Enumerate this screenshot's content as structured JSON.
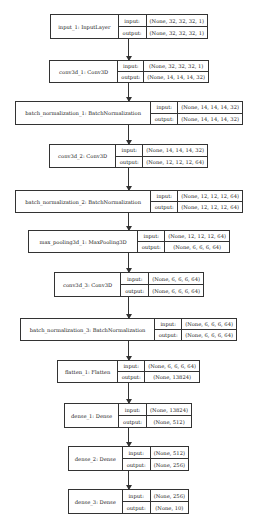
{
  "diagram": {
    "type": "keras_model_plot",
    "io_labels": {
      "input": "input:",
      "output": "output:"
    },
    "nodes": [
      {
        "name": "input_1: InputLayer",
        "input": "(None, 32, 32, 32, 1)",
        "output": "(None, 32, 32, 32, 1)"
      },
      {
        "name": "conv3d_1: Conv3D",
        "input": "(None, 32, 32, 32, 1)",
        "output": "(None, 14, 14, 14, 32)"
      },
      {
        "name": "batch_normalization_1: BatchNormalization",
        "input": "(None, 14, 14, 14, 32)",
        "output": "(None, 14, 14, 14, 32)"
      },
      {
        "name": "conv3d_2: Conv3D",
        "input": "(None, 14, 14, 14, 32)",
        "output": "(None, 12, 12, 12, 64)"
      },
      {
        "name": "batch_normalization_2: BatchNormalization",
        "input": "(None, 12, 12, 12, 64)",
        "output": "(None, 12, 12, 12, 64)"
      },
      {
        "name": "max_pooling3d_1: MaxPooling3D",
        "input": "(None, 12, 12, 12, 64)",
        "output": "(None, 6, 6, 6, 64)"
      },
      {
        "name": "conv3d_3: Conv3D",
        "input": "(None, 6, 6, 6, 64)",
        "output": "(None, 6, 6, 6, 64)"
      },
      {
        "name": "batch_normalization_3: BatchNormalization",
        "input": "(None, 6, 6, 6, 64)",
        "output": "(None, 6, 6, 6, 64)"
      },
      {
        "name": "flatten_1: Flatten",
        "input": "(None, 6, 6, 6, 64)",
        "output": "(None, 13824)"
      },
      {
        "name": "dense_1: Dense",
        "input": "(None, 13824)",
        "output": "(None, 512)"
      },
      {
        "name": "dense_2: Dense",
        "input": "(None, 512)",
        "output": "(None, 256)"
      },
      {
        "name": "dense_3: Dense",
        "input": "(None, 256)",
        "output": "(None, 10)"
      }
    ]
  }
}
